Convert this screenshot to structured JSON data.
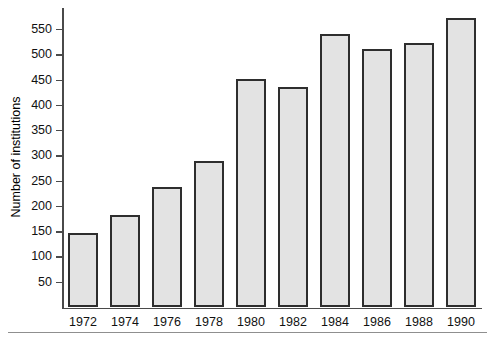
{
  "chart_data": {
    "type": "bar",
    "title": "",
    "xlabel": "",
    "ylabel": "Number of institutions",
    "categories": [
      "1972",
      "1974",
      "1976",
      "1978",
      "1980",
      "1982",
      "1984",
      "1986",
      "1988",
      "1990"
    ],
    "values": [
      147,
      182,
      238,
      290,
      452,
      435,
      540,
      510,
      522,
      572
    ],
    "ylim": [
      0,
      580
    ],
    "yticks": [
      50,
      100,
      150,
      200,
      250,
      300,
      350,
      400,
      450,
      500,
      550
    ],
    "ytick_labels": [
      "50",
      "100",
      "150",
      "200",
      "250",
      "300",
      "350",
      "400",
      "450",
      "500",
      "550"
    ],
    "grid": false,
    "legend": "none",
    "bar_fill_color": "#e3e3e3",
    "bar_edge_color": "#2e2e2e",
    "axis_color": "#4a4a4a",
    "text_color": "#111111"
  },
  "figure": {
    "bottom_rule_color": "#8f8f8f"
  }
}
